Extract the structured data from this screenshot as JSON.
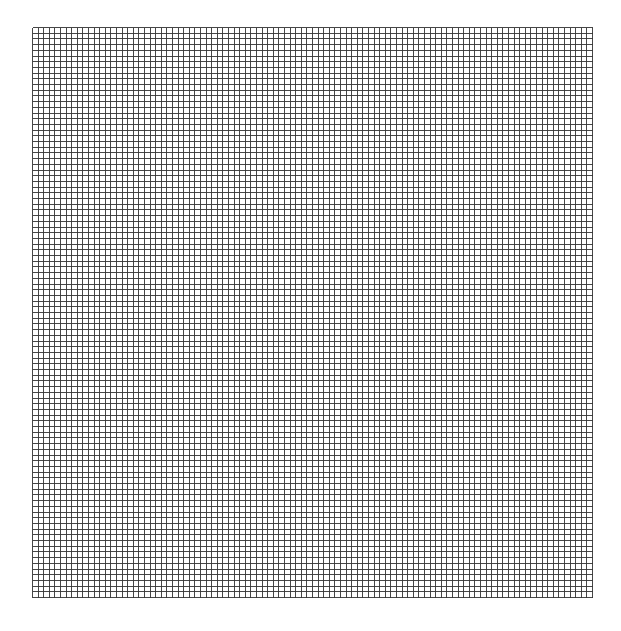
{
  "grid": {
    "x": 32,
    "y": 27,
    "width": 560,
    "height": 570,
    "columns": 100,
    "rows": 100,
    "line_color": "#333333",
    "background": "#ffffff",
    "line_width": 0.9
  }
}
